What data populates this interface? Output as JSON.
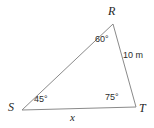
{
  "figure": {
    "type": "triangle-geometry-diagram",
    "background_color": "#ffffff",
    "stroke_color": "#8a8a8a",
    "text_color": "#2b2b2b",
    "width": 154,
    "height": 128
  },
  "vertices": [
    {
      "id": "R",
      "label": "R",
      "x": 113,
      "y": 24
    },
    {
      "id": "S",
      "label": "S",
      "x": 22,
      "y": 110
    },
    {
      "id": "T",
      "label": "T",
      "x": 136,
      "y": 107
    }
  ],
  "angles": [
    {
      "at": "R",
      "label": "60°",
      "value": 60
    },
    {
      "at": "S",
      "label": "45°",
      "value": 45
    },
    {
      "at": "T",
      "label": "75°",
      "value": 75
    }
  ],
  "sides": [
    {
      "between": "RT",
      "label": "10 m",
      "value": 10,
      "unit": "m",
      "known": true
    },
    {
      "between": "ST",
      "label": "x",
      "value": null,
      "unit": null,
      "known": false
    },
    {
      "between": "SR",
      "label": "",
      "value": null,
      "unit": null,
      "known": false
    }
  ]
}
